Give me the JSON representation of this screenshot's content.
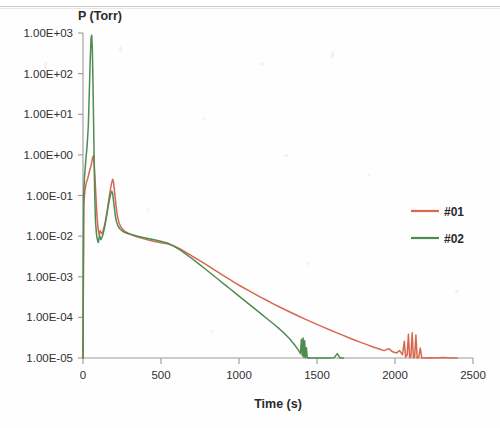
{
  "chart_data": {
    "type": "line",
    "title": "",
    "xlabel": "Time (s)",
    "ylabel": "P (Torr)",
    "yscale": "log",
    "xlim": [
      0,
      2500
    ],
    "ylim": [
      1e-05,
      1000
    ],
    "grid": false,
    "legend_position": "right",
    "x_ticks": [
      0,
      500,
      1000,
      1500,
      2000,
      2500
    ],
    "x_tick_labels": [
      "0",
      "500",
      "1000",
      "1500",
      "2000",
      "2500"
    ],
    "y_ticks": [
      1000,
      100,
      10,
      1,
      0.1,
      0.01,
      0.001,
      0.0001,
      1e-05
    ],
    "y_tick_labels": [
      "1.00E+03",
      "1.00E+02",
      "1.00E+01",
      "1.00E+00",
      "1.00E-01",
      "1.00E-02",
      "1.00E-03",
      "1.00E-04",
      "1.00E-05"
    ],
    "series": [
      {
        "name": "#01",
        "color": "#D9674F",
        "points": [
          [
            0,
            1e-05
          ],
          [
            5,
            0.06
          ],
          [
            12,
            0.13
          ],
          [
            20,
            0.2
          ],
          [
            30,
            0.26
          ],
          [
            42,
            0.4
          ],
          [
            52,
            0.55
          ],
          [
            60,
            0.8
          ],
          [
            66,
            0.95
          ],
          [
            72,
            0.6
          ],
          [
            78,
            0.22
          ],
          [
            84,
            0.08
          ],
          [
            90,
            0.03
          ],
          [
            96,
            0.016
          ],
          [
            102,
            0.011
          ],
          [
            110,
            0.0135
          ],
          [
            118,
            0.0115
          ],
          [
            126,
            0.0125
          ],
          [
            134,
            0.016
          ],
          [
            142,
            0.022
          ],
          [
            150,
            0.032
          ],
          [
            158,
            0.05
          ],
          [
            166,
            0.082
          ],
          [
            174,
            0.13
          ],
          [
            182,
            0.19
          ],
          [
            190,
            0.25
          ],
          [
            196,
            0.21
          ],
          [
            204,
            0.11
          ],
          [
            212,
            0.055
          ],
          [
            220,
            0.032
          ],
          [
            230,
            0.022
          ],
          [
            242,
            0.017
          ],
          [
            256,
            0.0145
          ],
          [
            272,
            0.0128
          ],
          [
            290,
            0.0118
          ],
          [
            312,
            0.0108
          ],
          [
            340,
            0.0098
          ],
          [
            380,
            0.0088
          ],
          [
            420,
            0.008
          ],
          [
            460,
            0.0074
          ],
          [
            500,
            0.0069
          ],
          [
            540,
            0.0065
          ],
          [
            580,
            0.0058
          ],
          [
            620,
            0.0049
          ],
          [
            660,
            0.004
          ],
          [
            700,
            0.0032
          ],
          [
            740,
            0.0026
          ],
          [
            780,
            0.0021
          ],
          [
            820,
            0.00168
          ],
          [
            860,
            0.00134
          ],
          [
            900,
            0.00107
          ],
          [
            940,
            0.00086
          ],
          [
            980,
            0.00069
          ],
          [
            1020,
            0.00056
          ],
          [
            1060,
            0.00046
          ],
          [
            1100,
            0.00038
          ],
          [
            1140,
            0.00031
          ],
          [
            1180,
            0.00026
          ],
          [
            1220,
            0.000215
          ],
          [
            1260,
            0.00018
          ],
          [
            1300,
            0.000152
          ],
          [
            1340,
            0.000128
          ],
          [
            1380,
            0.000108
          ],
          [
            1420,
            9.2e-05
          ],
          [
            1460,
            7.85e-05
          ],
          [
            1500,
            6.7e-05
          ],
          [
            1540,
            5.75e-05
          ],
          [
            1580,
            4.95e-05
          ],
          [
            1620,
            4.28e-05
          ],
          [
            1660,
            3.7e-05
          ],
          [
            1700,
            3.2e-05
          ],
          [
            1740,
            2.78e-05
          ],
          [
            1780,
            2.43e-05
          ],
          [
            1820,
            2.13e-05
          ],
          [
            1860,
            1.87e-05
          ],
          [
            1900,
            1.66e-05
          ],
          [
            1930,
            1.52e-05
          ],
          [
            1960,
            1.7e-05
          ],
          [
            1985,
            1.42e-05
          ],
          [
            2010,
            1.33e-05
          ],
          [
            2030,
            1.52e-05
          ],
          [
            2048,
            1.2e-05
          ],
          [
            2060,
            2.6e-05
          ],
          [
            2068,
            1.05e-05
          ],
          [
            2078,
            1.18e-05
          ],
          [
            2086,
            3.85e-05
          ],
          [
            2094,
            1.01e-05
          ],
          [
            2102,
            1.12e-05
          ],
          [
            2110,
            4.2e-05
          ],
          [
            2118,
            1e-05
          ],
          [
            2126,
            1.08e-05
          ],
          [
            2134,
            3.7e-05
          ],
          [
            2142,
            1e-05
          ],
          [
            2152,
            1.04e-05
          ],
          [
            2162,
            1.75e-05
          ],
          [
            2172,
            1e-05
          ],
          [
            2190,
            1e-05
          ],
          [
            2220,
            1.02e-05
          ],
          [
            2260,
            1e-05
          ],
          [
            2310,
            1.03e-05
          ],
          [
            2360,
            1e-05
          ],
          [
            2400,
            1e-05
          ]
        ]
      },
      {
        "name": "#02",
        "color": "#4E8C52",
        "points": [
          [
            0,
            1e-05
          ],
          [
            4,
            0.1
          ],
          [
            10,
            0.3
          ],
          [
            18,
            0.75
          ],
          [
            26,
            1.6
          ],
          [
            34,
            5.0
          ],
          [
            40,
            30
          ],
          [
            46,
            200
          ],
          [
            52,
            780
          ],
          [
            56,
            880
          ],
          [
            60,
            400
          ],
          [
            64,
            60
          ],
          [
            68,
            6.0
          ],
          [
            72,
            0.5
          ],
          [
            76,
            0.08
          ],
          [
            80,
            0.024
          ],
          [
            86,
            0.0115
          ],
          [
            92,
            0.0082
          ],
          [
            98,
            0.007
          ],
          [
            106,
            0.0105
          ],
          [
            114,
            0.0082
          ],
          [
            122,
            0.0092
          ],
          [
            130,
            0.0118
          ],
          [
            138,
            0.016
          ],
          [
            146,
            0.0235
          ],
          [
            154,
            0.036
          ],
          [
            162,
            0.056
          ],
          [
            170,
            0.082
          ],
          [
            178,
            0.11
          ],
          [
            184,
            0.128
          ],
          [
            190,
            0.112
          ],
          [
            198,
            0.062
          ],
          [
            206,
            0.034
          ],
          [
            214,
            0.023
          ],
          [
            224,
            0.018
          ],
          [
            236,
            0.0152
          ],
          [
            250,
            0.0135
          ],
          [
            266,
            0.0124
          ],
          [
            286,
            0.0116
          ],
          [
            310,
            0.0109
          ],
          [
            344,
            0.0101
          ],
          [
            384,
            0.0093
          ],
          [
            424,
            0.0086
          ],
          [
            464,
            0.008
          ],
          [
            504,
            0.0074
          ],
          [
            544,
            0.0067
          ],
          [
            584,
            0.0056
          ],
          [
            624,
            0.0045
          ],
          [
            664,
            0.0035
          ],
          [
            704,
            0.0027
          ],
          [
            744,
            0.00205
          ],
          [
            784,
            0.00155
          ],
          [
            824,
            0.00117
          ],
          [
            864,
            0.00088
          ],
          [
            904,
            0.00066
          ],
          [
            944,
            0.0005
          ],
          [
            984,
            0.000375
          ],
          [
            1024,
            0.000282
          ],
          [
            1064,
            0.000212
          ],
          [
            1104,
            0.000159
          ],
          [
            1144,
            0.00012
          ],
          [
            1184,
            9e-05
          ],
          [
            1224,
            6.78e-05
          ],
          [
            1250,
            5.6e-05
          ],
          [
            1272,
            4.7e-05
          ],
          [
            1292,
            3.98e-05
          ],
          [
            1310,
            3.4e-05
          ],
          [
            1326,
            2.92e-05
          ],
          [
            1340,
            2.52e-05
          ],
          [
            1352,
            2.22e-05
          ],
          [
            1362,
            1.97e-05
          ],
          [
            1372,
            1.75e-05
          ],
          [
            1380,
            1.58e-05
          ],
          [
            1388,
            1.42e-05
          ],
          [
            1394,
            1.28e-05
          ],
          [
            1400,
            2.9e-05
          ],
          [
            1406,
            1.12e-05
          ],
          [
            1411,
            3.1e-05
          ],
          [
            1416,
            1.05e-05
          ],
          [
            1421,
            2.65e-05
          ],
          [
            1426,
            1.02e-05
          ],
          [
            1432,
            1.8e-05
          ],
          [
            1438,
            1e-05
          ],
          [
            1448,
            1.02e-05
          ],
          [
            1462,
            1e-05
          ],
          [
            1490,
            1e-05
          ],
          [
            1530,
            1e-05
          ],
          [
            1570,
            1e-05
          ],
          [
            1610,
            1.02e-05
          ],
          [
            1630,
            1.28e-05
          ],
          [
            1648,
            1e-05
          ],
          [
            1670,
            1e-05
          ]
        ]
      }
    ]
  },
  "legend": {
    "items": [
      {
        "label": "#01",
        "color": "#D9674F"
      },
      {
        "label": "#02",
        "color": "#4E8C52"
      }
    ]
  }
}
